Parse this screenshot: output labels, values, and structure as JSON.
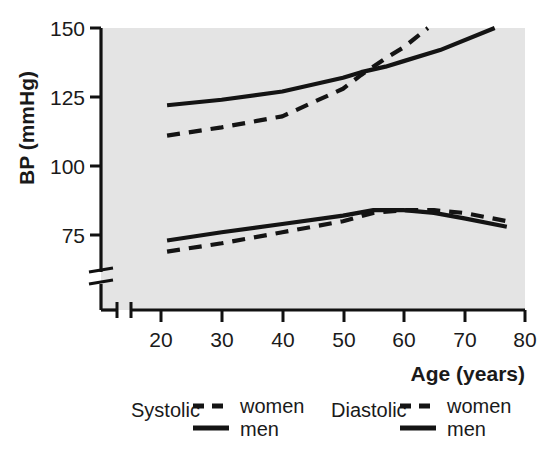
{
  "chart_data": {
    "type": "line",
    "title": "",
    "xlabel": "Age (years)",
    "ylabel": "BP (mmHg)",
    "xlim": [
      15,
      80
    ],
    "ylim": [
      62,
      153
    ],
    "xticks": [
      20,
      30,
      40,
      50,
      60,
      70,
      80
    ],
    "yticks": [
      75,
      100,
      125,
      150
    ],
    "xtick_labels": [
      "20",
      "30",
      "40",
      "50",
      "60",
      "70",
      "80"
    ],
    "ytick_labels": [
      "75",
      "100",
      "125",
      "150"
    ],
    "grid": false,
    "axis_break_y": true,
    "axis_break_x": true,
    "legend_position": "below-plot",
    "plot_background": "#e4e4e4",
    "line_color": "#141414",
    "series": [
      {
        "name": "Systolic women",
        "measure": "Systolic",
        "sex": "women",
        "style": "dashed",
        "x": [
          21,
          30,
          40,
          50,
          53,
          57,
          60,
          64
        ],
        "values": [
          111,
          114,
          118,
          128,
          133,
          139,
          143,
          150
        ]
      },
      {
        "name": "Systolic men",
        "measure": "Systolic",
        "sex": "men",
        "style": "solid",
        "x": [
          21,
          30,
          40,
          50,
          53,
          57,
          60,
          66,
          75
        ],
        "values": [
          122,
          124,
          127,
          132,
          134,
          136,
          138,
          142,
          150
        ]
      },
      {
        "name": "Diastolic women",
        "measure": "Diastolic",
        "sex": "women",
        "style": "dashed",
        "x": [
          21,
          30,
          40,
          50,
          55,
          60,
          65,
          70,
          77
        ],
        "values": [
          69,
          72,
          76,
          80,
          83,
          84,
          84,
          83,
          80
        ]
      },
      {
        "name": "Diastolic men",
        "measure": "Diastolic",
        "sex": "men",
        "style": "solid",
        "x": [
          21,
          30,
          40,
          50,
          55,
          60,
          65,
          70,
          77
        ],
        "values": [
          73,
          76,
          79,
          82,
          84,
          84,
          83,
          81,
          78
        ]
      }
    ],
    "annotations": []
  },
  "axes": {
    "y_title": "BP (mmHg)",
    "x_title": "Age (years)",
    "y_ticks": [
      "150",
      "125",
      "100",
      "75"
    ],
    "x_ticks": [
      "20",
      "30",
      "40",
      "50",
      "60",
      "70",
      "80"
    ]
  },
  "legend": {
    "groups": [
      {
        "label": "Systolic",
        "entries": [
          {
            "label": "women",
            "style": "dashed"
          },
          {
            "label": "men",
            "style": "solid"
          }
        ]
      },
      {
        "label": "Diastolic",
        "entries": [
          {
            "label": "women",
            "style": "dashed"
          },
          {
            "label": "men",
            "style": "solid"
          }
        ]
      }
    ]
  }
}
